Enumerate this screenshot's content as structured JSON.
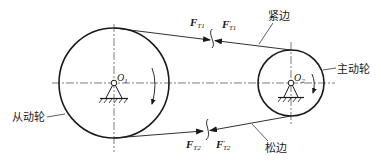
{
  "diagram": {
    "colors": {
      "line": "#1a1a1a",
      "background": "#ffffff"
    },
    "pulleys": {
      "driven": {
        "label": "从动轮",
        "center_label": "O",
        "center_sub": "1",
        "cx": 114,
        "cy": 83,
        "r": 55
      },
      "driving": {
        "label": "主动轮",
        "center_label": "O",
        "center_sub": "2",
        "cx": 291,
        "cy": 83,
        "r": 33
      }
    },
    "belt": {
      "tight_side_label": "紧边",
      "slack_side_label": "松边"
    },
    "forces": {
      "ft1": {
        "symbol": "F",
        "sub": "T1",
        "prime": ""
      },
      "ft1_prime": {
        "symbol": "F",
        "sub": "T1",
        "prime": "′"
      },
      "ft2": {
        "symbol": "F",
        "sub": "T2",
        "prime": ""
      },
      "ft2_prime": {
        "symbol": "F",
        "sub": "T2",
        "prime": "′"
      }
    }
  }
}
